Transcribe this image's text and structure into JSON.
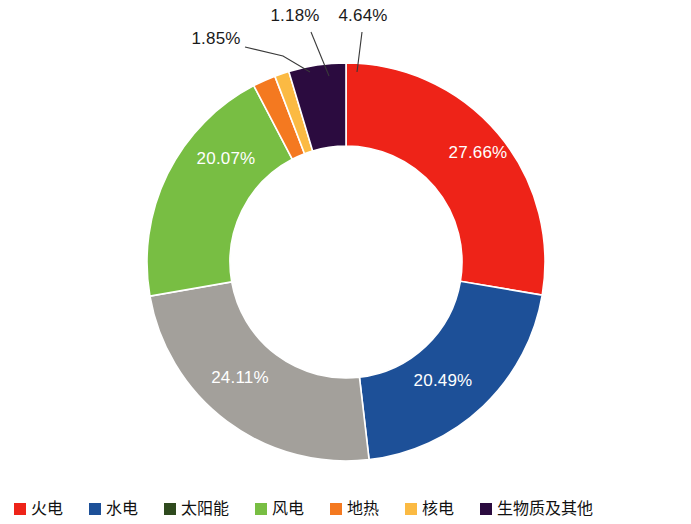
{
  "chart_data": {
    "type": "pie",
    "variant": "donut",
    "title": "",
    "subtitle": "",
    "xlabel": "",
    "ylabel": "",
    "grid": false,
    "legend_position": "bottom",
    "start_angle_deg": 0,
    "direction": "clockwise",
    "center": {
      "x": 346,
      "y": 262
    },
    "outer_radius": 199,
    "inner_radius": 116,
    "categories": [
      "火电",
      "水电",
      "太阳能",
      "风电",
      "地热",
      "核电",
      "生物质及其他"
    ],
    "values": [
      27.66,
      20.49,
      24.11,
      20.07,
      1.85,
      1.18,
      4.64
    ],
    "value_labels": [
      "27.66%",
      "20.49%",
      "24.11%",
      "20.07%",
      "1.85%",
      "1.18%",
      "4.64%"
    ],
    "colors": [
      "#EE2318",
      "#1D5098",
      "#A3A09B",
      "#78BE43",
      "#F47920",
      "#FBBA43",
      "#2B0B3F"
    ],
    "legend_colors": [
      "#EE2318",
      "#1D5098",
      "#2F4A1E",
      "#78BE43",
      "#F47920",
      "#FBBA43",
      "#2B0B3F"
    ],
    "slices": [
      {
        "label": "火电",
        "value": 27.66,
        "value_label": "27.66%",
        "color": "#EE2318",
        "label_placement": "inside"
      },
      {
        "label": "水电",
        "value": 20.49,
        "value_label": "20.49%",
        "color": "#1D5098",
        "label_placement": "inside"
      },
      {
        "label": "太阳能",
        "value": 24.11,
        "value_label": "24.11%",
        "color": "#A3A09B",
        "label_placement": "inside"
      },
      {
        "label": "风电",
        "value": 20.07,
        "value_label": "20.07%",
        "color": "#78BE43",
        "label_placement": "inside"
      },
      {
        "label": "地热",
        "value": 1.85,
        "value_label": "1.85%",
        "color": "#F47920",
        "label_placement": "outside-leader"
      },
      {
        "label": "核电",
        "value": 1.18,
        "value_label": "1.18%",
        "color": "#FBBA43",
        "label_placement": "outside-leader"
      },
      {
        "label": "生物质及其他",
        "value": 4.64,
        "value_label": "4.64%",
        "color": "#2B0B3F",
        "label_placement": "outside-leader"
      }
    ]
  },
  "labels": {
    "red": "27.66%",
    "blue": "20.49%",
    "gray": "24.11%",
    "green": "20.07%",
    "orange": "1.85%",
    "amber": "1.18%",
    "purple": "4.64%"
  },
  "legend": {
    "items": [
      {
        "label": "火电",
        "color": "#EE2318"
      },
      {
        "label": "水电",
        "color": "#1D5098"
      },
      {
        "label": "太阳能",
        "color": "#2F4A1E"
      },
      {
        "label": "风电",
        "color": "#78BE43"
      },
      {
        "label": "地热",
        "color": "#F47920"
      },
      {
        "label": "核电",
        "color": "#FBBA43"
      },
      {
        "label": "生物质及其他",
        "color": "#2B0B3F"
      }
    ]
  }
}
